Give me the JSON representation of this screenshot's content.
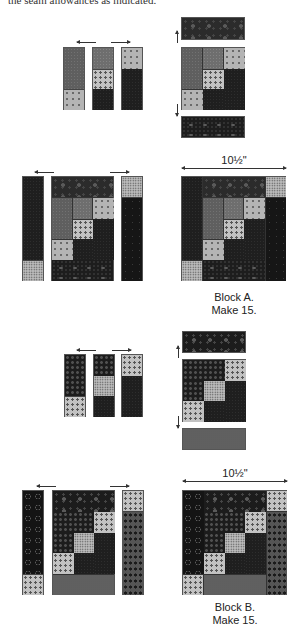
{
  "intro_text": "the seam allowances as indicated.",
  "colors": {
    "background": "#ffffff",
    "outline": "#555555",
    "arrow": "#333333",
    "text": "#222222"
  },
  "block_a": {
    "dimension_label": "10½\"",
    "caption_line1": "Block A.",
    "caption_line2": "Make 15."
  },
  "block_b": {
    "dimension_label": "10½\"",
    "caption_line1": "Block B.",
    "caption_line2": "Make 15."
  }
}
